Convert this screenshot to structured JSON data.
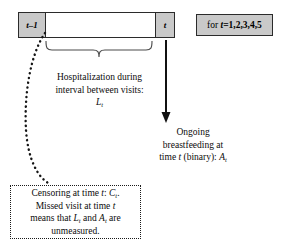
{
  "diagram": {
    "timeline": {
      "left_cell_label": "t–1",
      "right_cell_label": "t",
      "middle_cell_label": ""
    },
    "for_box": {
      "text": "for t=1,2,3,4,5",
      "prefix": "for ",
      "variable": "t",
      "values": "=1,2,3,4,5"
    },
    "hospitalization": {
      "line1": "Hospitalization during",
      "line2": "interval between visits:",
      "symbol_base": "L",
      "symbol_sub": "t"
    },
    "breastfeeding": {
      "line1": "Ongoing",
      "line2": "breastfeeding at",
      "line3_a": "time ",
      "line3_t": "t",
      "line3_b": " (binary): ",
      "symbol_base": "A",
      "symbol_sub": "t"
    },
    "censoring": {
      "line1_a": "Censoring at time ",
      "line1_t": "t",
      "line1_b": ": ",
      "line1_symbol": "C",
      "line1_sub": "t",
      "line1_end": ".",
      "line2_a": "Missed visit at time ",
      "line2_t": "t",
      "line3_a": "means that ",
      "line3_sym1": "L",
      "line3_sub1": "t",
      "line3_mid": " and ",
      "line3_sym2": "A",
      "line3_sub2": "t",
      "line3_end": " are",
      "line4": "unmeasured."
    },
    "colors": {
      "cell_fill": "#c9c9c9",
      "stroke": "#2b2b2b",
      "text": "#0b0b0b",
      "background": "#ffffff"
    },
    "connectors": {
      "brace_name": "curly-brace-under-interval",
      "arrow_name": "down-arrow-to-breastfeeding",
      "dotted_name": "dotted-curve-to-censoring"
    }
  }
}
